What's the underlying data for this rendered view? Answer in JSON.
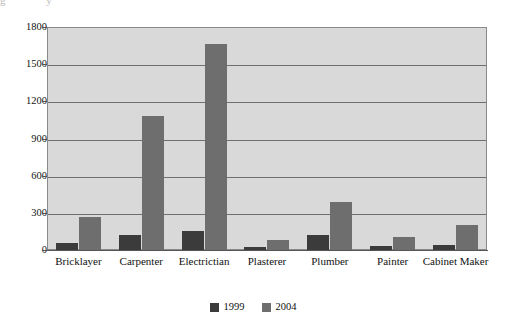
{
  "top_fragment": [
    "g",
    "y"
  ],
  "chart_data": {
    "type": "bar",
    "title": "",
    "subtitle": "",
    "xlabel": "",
    "ylabel": "",
    "categories": [
      "Bricklayer",
      "Carpenter",
      "Electrictian",
      "Plasterer",
      "Plumber",
      "Painter",
      "Cabinet Maker"
    ],
    "series": [
      {
        "name": "1999",
        "color": "#3b3b3b",
        "values": [
          60,
          120,
          150,
          25,
          120,
          35,
          40
        ]
      },
      {
        "name": "2004",
        "color": "#6e6e6e",
        "values": [
          265,
          1080,
          1660,
          80,
          385,
          105,
          205
        ]
      }
    ],
    "ylim": [
      0,
      1800
    ],
    "yticks": [
      0,
      300,
      600,
      900,
      1200,
      1500,
      1800
    ],
    "ytick_labels": [
      "0",
      "300",
      "600",
      "900",
      "1200",
      "1500",
      "1800"
    ],
    "grid": true,
    "legend_position": "bottom",
    "plot_background": "#d9d9d9"
  }
}
